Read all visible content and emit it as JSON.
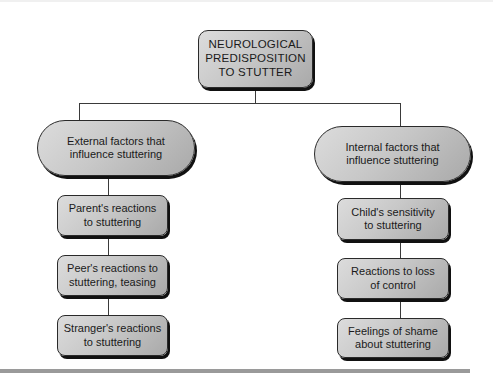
{
  "diagram": {
    "root": {
      "label": "NEUROLOGICAL\nPREDISPOSITION\nTO STUTTER"
    },
    "branches": [
      {
        "label": "External factors that\ninfluence stuttering",
        "children": [
          {
            "label": "Parent's reactions\nto stuttering"
          },
          {
            "label": "Peer's reactions to\nstuttering, teasing"
          },
          {
            "label": "Stranger's reactions\nto stuttering"
          }
        ]
      },
      {
        "label": "Internal factors that\ninfluence stuttering",
        "children": [
          {
            "label": "Child's sensitivity\nto stuttering"
          },
          {
            "label": "Reactions to loss\nof control"
          },
          {
            "label": "Feelings of shame\nabout stuttering"
          }
        ]
      }
    ]
  },
  "colors": {
    "box_fill_light": "#dcdcdc",
    "box_fill_dark": "#a9a9a9",
    "border": "#2a2a2a",
    "rule": "#9a9a9a"
  }
}
